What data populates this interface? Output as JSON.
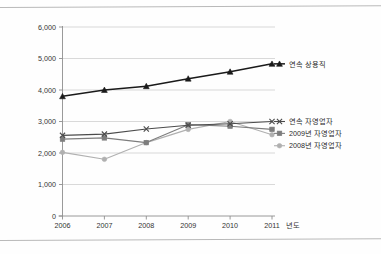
{
  "chart_data": {
    "type": "line",
    "title": "",
    "xlabel": "년도",
    "ylabel": "",
    "x": [
      2006,
      2007,
      2008,
      2009,
      2010,
      2011
    ],
    "categories": [
      "2006",
      "2007",
      "2008",
      "2009",
      "2010",
      "2011"
    ],
    "ylim": [
      0,
      6000
    ],
    "yticks": [
      0,
      1000,
      2000,
      3000,
      4000,
      5000,
      6000
    ],
    "ytick_labels": [
      "0",
      "1,000",
      "2,000",
      "3,000",
      "4,000",
      "5,000",
      "6,000"
    ],
    "grid": true,
    "legend_position": "right",
    "series": [
      {
        "name": "연속 상용직",
        "marker": "triangle",
        "color": "#1a1a1a",
        "values": [
          3800,
          4000,
          4120,
          4360,
          4580,
          4830
        ]
      },
      {
        "name": "연속 자영업자",
        "marker": "x",
        "color": "#4b4b4b",
        "values": [
          2560,
          2600,
          2760,
          2880,
          2930,
          3000
        ]
      },
      {
        "name": "2009년 자영업자",
        "marker": "square",
        "color": "#7d7d7d",
        "values": [
          2440,
          2480,
          2330,
          2900,
          2850,
          2750
        ]
      },
      {
        "name": "2008년 자영업자",
        "marker": "circle",
        "color": "#b0b0b0",
        "values": [
          2020,
          1800,
          2330,
          2750,
          3000,
          2580
        ]
      }
    ]
  },
  "axis": {
    "x_title": "년도",
    "x_ticks": [
      "2006",
      "2007",
      "2008",
      "2009",
      "2010",
      "2011"
    ],
    "y_ticks": [
      "6,000",
      "5,000",
      "4,000",
      "3,000",
      "2,000",
      "1,000",
      "0"
    ]
  },
  "legend": {
    "items": [
      {
        "label": "연속 상용직"
      },
      {
        "label": "연속 자영업자"
      },
      {
        "label": "2009년 자영업자"
      },
      {
        "label": "2008년 자영업자"
      }
    ]
  },
  "colors": {
    "series1": "#1a1a1a",
    "series2": "#4b4b4b",
    "series3": "#7d7d7d",
    "series4": "#b0b0b0",
    "grid": "#c8c8c8",
    "axis": "#8f8f8f",
    "border": "#b9b9b9"
  }
}
